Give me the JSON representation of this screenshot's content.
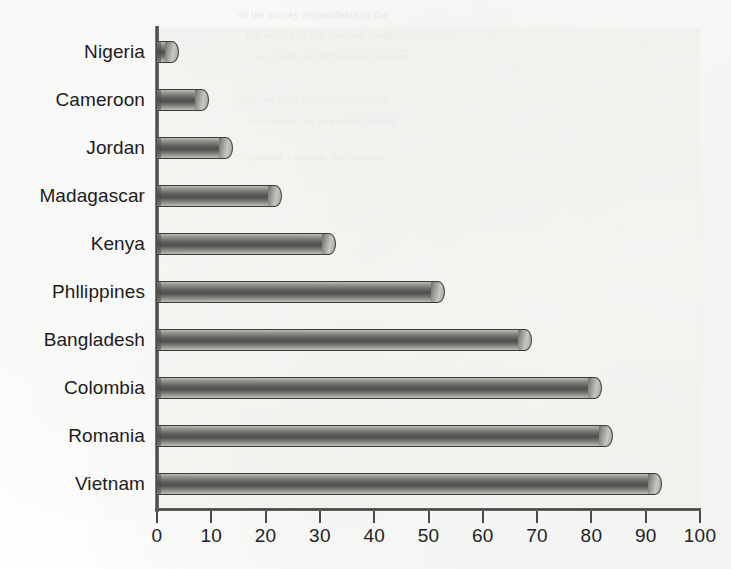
{
  "chart_data": {
    "type": "bar",
    "orientation": "horizontal",
    "title": "",
    "subtitle": "",
    "xlabel": "",
    "ylabel": "",
    "xlim": [
      0,
      100
    ],
    "xticks": [
      0,
      10,
      20,
      30,
      40,
      50,
      60,
      70,
      80,
      90,
      100
    ],
    "grid": false,
    "legend": false,
    "bar_style": "cylinder",
    "categories": [
      "Nigeria",
      "Cameroon",
      "Jordan",
      "Madagascar",
      "Kenya",
      "Phllippines",
      "Bangladesh",
      "Colombia",
      "Romania",
      "Vietnam"
    ],
    "values": [
      4,
      9.5,
      14,
      23,
      33,
      53,
      69,
      82,
      84,
      93
    ]
  },
  "colors": {
    "bar_dark": "#4e4e4c",
    "bar_light": "#bdbdba",
    "axis": "#3f3f3d",
    "text": "#1c1c1c",
    "plot_bg": "#f0f0ed",
    "page_bg": "#fdfdfb"
  },
  "ghost_text": {
    "lines": [
      "of the survey respondents in the",
      "the results of the national study",
      "no significant difference between",
      "and the total population sample",
      "been observed in earlier reports",
      "reported a similar distribution"
    ]
  }
}
